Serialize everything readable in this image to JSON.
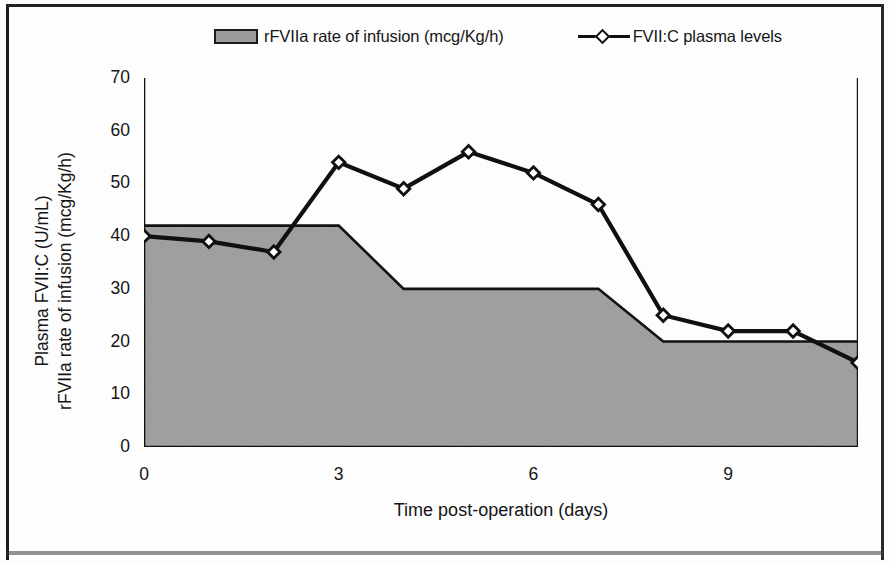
{
  "figure": {
    "background_color": "#fdfdfd",
    "frame_color": "#1a1a1a"
  },
  "legend": {
    "position": "top-center",
    "entries": [
      {
        "label": "rFVIIa rate of infusion (mcg/Kg/h)",
        "marker": "filled-square-swatch",
        "color": "#9c9c9c"
      },
      {
        "label": "FVII:C plasma levels",
        "marker": "open-diamond-line",
        "color": "#101010"
      }
    ]
  },
  "axes": {
    "y_title_line1": "Plasma FVII:C (U/mL)",
    "y_title_line2": "rFVIIa rate of infusion (mcg/Kg/h)",
    "x_title": "Time post-operation (days)",
    "y_ticks": [
      0,
      10,
      20,
      30,
      40,
      50,
      60,
      70
    ],
    "y_tick_labels": [
      "0",
      "10",
      "20",
      "30",
      "40",
      "50",
      "60",
      "70"
    ],
    "x_ticks": [
      0,
      1,
      2,
      3,
      4,
      5,
      6,
      7,
      8,
      9,
      10,
      11
    ],
    "x_tick_labels": [
      "0",
      "",
      "",
      "3",
      "",
      "",
      "6",
      "",
      "",
      "9",
      "",
      ""
    ]
  },
  "chart_data": {
    "type": "line",
    "title": "",
    "xlabel": "Time post-operation (days)",
    "ylabel": "Plasma FVII:C (U/mL) / rFVIIa rate of infusion (mcg/Kg/h)",
    "xlim": [
      0,
      11
    ],
    "ylim": [
      0,
      70
    ],
    "grid": false,
    "legend_position": "top-center",
    "x": [
      0,
      1,
      2,
      3,
      4,
      5,
      6,
      7,
      8,
      9,
      10,
      11
    ],
    "series": [
      {
        "name": "rFVIIa rate of infusion (mcg/Kg/h)",
        "type": "area",
        "color": "#9c9c9c",
        "edge_color": "#121212",
        "values": [
          42,
          42,
          42,
          42,
          30,
          30,
          30,
          30,
          20,
          20,
          20,
          20
        ]
      },
      {
        "name": "FVII:C plasma levels",
        "type": "line",
        "color": "#101010",
        "marker": "open-diamond",
        "values": [
          40,
          39,
          37,
          54,
          49,
          56,
          52,
          46,
          25,
          22,
          22,
          16
        ]
      }
    ]
  }
}
